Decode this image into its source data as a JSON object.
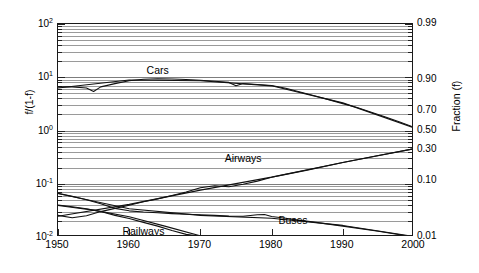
{
  "chart_data": {
    "type": "line",
    "title": "",
    "subtitle": "",
    "xlabel": "",
    "ylabel": "f/(1-f)",
    "ylabel_right": "Fraction (f)",
    "xlim": [
      1950,
      2000
    ],
    "ylim": [
      0.01,
      100
    ],
    "yscale": "log",
    "grid": true,
    "legend_position": "inline-annotations",
    "x_ticks": [
      1950,
      1960,
      1970,
      1980,
      1990,
      2000
    ],
    "x_tick_labels": [
      "1950",
      "1960",
      "1970",
      "1980",
      "1990",
      "2000"
    ],
    "y_ticks_left": [
      0.01,
      0.1,
      1,
      10,
      100
    ],
    "y_tick_labels_left": [
      "10-2",
      "10-1",
      "100",
      "101",
      "102"
    ],
    "y_ticks_left_display": [
      {
        "mantissa": "10",
        "exponent": "2",
        "value": 100
      },
      {
        "mantissa": "10",
        "exponent": "1",
        "value": 10
      },
      {
        "mantissa": "10",
        "exponent": "0",
        "value": 1
      },
      {
        "mantissa": "10",
        "exponent": "-1",
        "value": 0.1
      },
      {
        "mantissa": "10",
        "exponent": "-2",
        "value": 0.01
      }
    ],
    "y_ticks_right_fraction": [
      0.99,
      0.9,
      0.7,
      0.5,
      0.3,
      0.1,
      0.01
    ],
    "y_tick_labels_right": [
      "0.99",
      "0.90",
      "0.70",
      "0.50",
      "0.30",
      "0.10",
      "0.01"
    ],
    "series": [
      {
        "name": "Cars",
        "label": "Cars",
        "color": "#111111",
        "annotation_x": 1964,
        "annotation_y": 13.5,
        "x": [
          1950,
          1952,
          1954,
          1955,
          1956,
          1958,
          1960,
          1962,
          1964,
          1966,
          1968,
          1970,
          1972,
          1974,
          1975,
          1976,
          1978,
          1980,
          1982,
          1984,
          1986,
          1988,
          1990,
          1992,
          1994,
          1996,
          1998,
          2000
        ],
        "values": [
          6.6,
          6.6,
          6.3,
          5.4,
          6.6,
          7.6,
          8.6,
          9.2,
          9.4,
          9.3,
          9.1,
          8.8,
          8.4,
          8.0,
          6.9,
          7.6,
          7.3,
          7.0,
          6.2,
          5.3,
          4.5,
          3.8,
          3.2,
          2.7,
          2.2,
          1.8,
          1.45,
          1.15
        ]
      },
      {
        "name": "Cars fit",
        "label": "",
        "color": "#111111",
        "x": [
          1950,
          1960,
          1970,
          1980,
          1990,
          2000
        ],
        "values": [
          6.3,
          8.9,
          8.6,
          6.9,
          3.3,
          1.12
        ]
      },
      {
        "name": "Airways",
        "label": "Airways",
        "color": "#111111",
        "annotation_x": 1976,
        "annotation_y": 0.3,
        "x": [
          1950,
          1952,
          1954,
          1956,
          1958,
          1960,
          1962,
          1964,
          1966,
          1968,
          1970,
          1972,
          1974,
          1976,
          1978,
          1980,
          1982,
          1985,
          1990,
          1995,
          2000
        ],
        "values": [
          0.0255,
          0.023,
          0.025,
          0.03,
          0.0345,
          0.0395,
          0.046,
          0.052,
          0.06,
          0.07,
          0.084,
          0.092,
          0.088,
          0.098,
          0.112,
          0.132,
          0.15,
          0.18,
          0.25,
          0.34,
          0.455
        ]
      },
      {
        "name": "Airways fit",
        "label": "",
        "color": "#111111",
        "x": [
          1950,
          1960,
          1970,
          1980,
          1990,
          2000
        ],
        "values": [
          0.0245,
          0.041,
          0.076,
          0.133,
          0.25,
          0.455
        ]
      },
      {
        "name": "Buses",
        "label": "Buses",
        "color": "#111111",
        "annotation_x": 1983,
        "annotation_y": 0.0205,
        "x": [
          1950,
          1952,
          1954,
          1956,
          1958,
          1960,
          1962,
          1964,
          1966,
          1968,
          1970,
          1972,
          1974,
          1976,
          1978,
          1979,
          1980,
          1982,
          1984,
          1986,
          1990,
          1995,
          2000
        ],
        "values": [
          0.066,
          0.058,
          0.05,
          0.042,
          0.0345,
          0.031,
          0.0295,
          0.0285,
          0.0275,
          0.0268,
          0.0262,
          0.0255,
          0.0248,
          0.0245,
          0.0262,
          0.0265,
          0.0242,
          0.0225,
          0.0205,
          0.019,
          0.016,
          0.0128,
          0.01
        ]
      },
      {
        "name": "Buses fit",
        "label": "",
        "color": "#111111",
        "x": [
          1950,
          1960,
          1970,
          1980,
          1990,
          2000
        ],
        "values": [
          0.0655,
          0.034,
          0.0255,
          0.0225,
          0.0165,
          0.0102
        ]
      },
      {
        "name": "Railways",
        "label": "Railways",
        "color": "#111111",
        "annotation_x": 1962,
        "annotation_y": 0.0128,
        "x": [
          1950,
          1952,
          1954,
          1956,
          1958,
          1960,
          1962,
          1964,
          1966,
          1968,
          1970,
          1971,
          1972
        ],
        "values": [
          0.04,
          0.037,
          0.034,
          0.03,
          0.0255,
          0.0222,
          0.0188,
          0.016,
          0.0132,
          0.0112,
          0.0103,
          0.01,
          0.0099
        ]
      },
      {
        "name": "Railways fit",
        "label": "",
        "color": "#111111",
        "x": [
          1950,
          1955,
          1960,
          1965,
          1970,
          1972
        ],
        "values": [
          0.039,
          0.032,
          0.024,
          0.016,
          0.0105,
          0.01
        ]
      }
    ],
    "annotations": [
      {
        "name": "cars-label",
        "text": "Cars",
        "x": 1964,
        "y": 13.5
      },
      {
        "name": "airways-label",
        "text": "Airways",
        "x": 1976,
        "y": 0.3
      },
      {
        "name": "buses-label",
        "text": "Buses",
        "x": 1983,
        "y": 0.0205
      },
      {
        "name": "railways-label",
        "text": "Railways",
        "x": 1962,
        "y": 0.0128
      }
    ]
  },
  "axes": {
    "left_title": "f/(1-f)",
    "right_title": "Fraction (f)",
    "x_labels": [
      "1950",
      "1960",
      "1970",
      "1980",
      "1990",
      "2000"
    ],
    "y_left_labels": [
      {
        "base": "10",
        "exp": "2"
      },
      {
        "base": "10",
        "exp": "1"
      },
      {
        "base": "10",
        "exp": "0"
      },
      {
        "base": "10",
        "exp": "-1"
      },
      {
        "base": "10",
        "exp": "-2"
      }
    ],
    "y_right_labels": [
      "0.99",
      "0.90",
      "0.70",
      "0.50",
      "0.30",
      "0.10",
      "0.01"
    ]
  },
  "labels": {
    "cars": "Cars",
    "airways": "Airways",
    "buses": "Buses",
    "railways": "Railways"
  },
  "colors": {
    "line": "#111111",
    "grid": "#9a9a9a",
    "frame": "#1a1a1a",
    "background": "#ffffff"
  }
}
